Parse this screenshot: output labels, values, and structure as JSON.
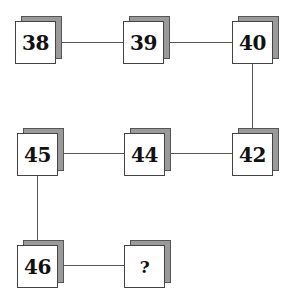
{
  "puzzle": {
    "type": "number-sequence-grid",
    "nodes": [
      {
        "id": "n1",
        "label": "38",
        "x": 15,
        "y": 21
      },
      {
        "id": "n2",
        "label": "39",
        "x": 123,
        "y": 21
      },
      {
        "id": "n3",
        "label": "40",
        "x": 232,
        "y": 21
      },
      {
        "id": "n4",
        "label": "42",
        "x": 232,
        "y": 133
      },
      {
        "id": "n5",
        "label": "44",
        "x": 124,
        "y": 133
      },
      {
        "id": "n6",
        "label": "45",
        "x": 17,
        "y": 133
      },
      {
        "id": "n7",
        "label": "46",
        "x": 17,
        "y": 245
      },
      {
        "id": "n8",
        "label": "?",
        "x": 124,
        "y": 245
      }
    ],
    "edges": [
      [
        "38",
        "39"
      ],
      [
        "39",
        "40"
      ],
      [
        "40",
        "42"
      ],
      [
        "42",
        "44"
      ],
      [
        "44",
        "45"
      ],
      [
        "45",
        "46"
      ],
      [
        "46",
        "?"
      ]
    ],
    "colors": {
      "face": "#ffffff",
      "shadow": "#9a9a9a",
      "border": "#444444",
      "line": "#555555",
      "text": "#111111"
    }
  }
}
